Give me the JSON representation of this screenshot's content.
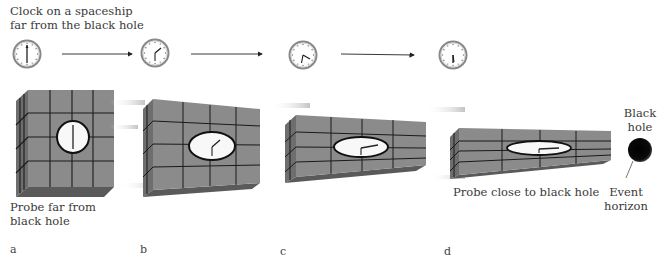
{
  "figure": {
    "top_caption": "Clock on a spaceship\nfar from the black hole",
    "probe_far_label": "Probe far from\nblack hole",
    "probe_close_label": "Probe close to black hole",
    "black_hole_label": "Black\nhole",
    "event_horizon_label": "Event\nhorizon",
    "panels": [
      {
        "letter": "a",
        "spaceship_clock": "12:30 (hands vertical)",
        "probe_clock": "12:30 (hands vertical)",
        "compression": "none"
      },
      {
        "letter": "b",
        "spaceship_clock": "hand at ~2 o'clock",
        "probe_clock": "hand at ~2 o'clock",
        "compression": "slight"
      },
      {
        "letter": "c",
        "spaceship_clock": "hand at ~4 o'clock",
        "probe_clock": "hand at ~3 o'clock",
        "compression": "moderate"
      },
      {
        "letter": "d",
        "spaceship_clock": "hand at ~6 o'clock",
        "probe_clock": "hand at ~3 o'clock",
        "compression": "strong"
      }
    ],
    "colors": {
      "probe_face": "#8a8a8a",
      "probe_side": "#6f6f6f",
      "grid_line": "#1a1a1a",
      "black_hole": "#000000",
      "arrow": "#222222"
    }
  }
}
